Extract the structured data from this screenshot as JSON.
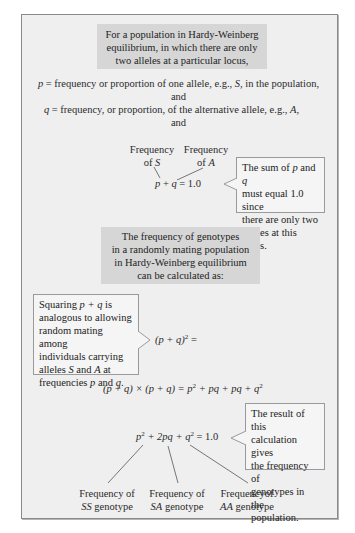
{
  "intro_box": {
    "lines": [
      "For a population in Hardy-Weinberg",
      "equilibrium, in which there are only",
      "two alleles at a particular locus,"
    ]
  },
  "definitions": {
    "p_symbol": "p",
    "p_text_a": " = frequency or proportion of one allele, e.g., ",
    "p_allele": "S",
    "p_text_b": ", in the population,",
    "and_1": "and",
    "q_symbol": "q",
    "q_text_a": " = frequency, or proportion, of the alternative allele, e.g., ",
    "q_allele": "A",
    "q_text_b": ",",
    "and_2": "and"
  },
  "sum_equation": {
    "label_s_line1": "Frequency",
    "label_s_line2_prefix": "of ",
    "label_s_allele": "S",
    "label_a_line1": "Frequency",
    "label_a_line2_prefix": "of ",
    "label_a_allele": "A",
    "p": "p",
    "plus": " + ",
    "q": "q",
    "equals": " = 1.0"
  },
  "sum_callout": {
    "line1_prefix": "The sum of ",
    "line1_p": "p",
    "line1_mid": " and ",
    "line1_q": "q",
    "line2": "must equal 1.0 since",
    "line3": "there are only two",
    "line4": "alleles at this locus."
  },
  "genotype_box": {
    "lines": [
      "The frequency of genotypes",
      "in a randomly mating population",
      "in Hardy-Weinberg equilibrium",
      "can be calculated as:"
    ]
  },
  "squaring_callout": {
    "line1_prefix": "Squaring ",
    "line1_expr": "p + q",
    "line1_suffix": " is",
    "line2": "analogous to allowing",
    "line3": "random mating among",
    "line4": "individuals carrying",
    "line5_prefix": "alleles ",
    "line5_s": "S",
    "line5_mid": " and ",
    "line5_a": "A",
    "line5_suffix": " at",
    "line6_prefix": "frequencies ",
    "line6_p": "p",
    "line6_mid": " and ",
    "line6_q": "q",
    "line6_suffix": "."
  },
  "square_equation": {
    "left": "(p + q)",
    "exp": "2",
    "right": " ="
  },
  "expansion_equation": {
    "lhs": "(p + q) × (p + q) = p",
    "exp1": "2",
    "mid": " + pq + pq + q",
    "exp2": "2"
  },
  "result_equation": {
    "p": "p",
    "exp1": "2",
    "mid": " + 2pq + q",
    "exp2": "2",
    "rhs": " = 1.0"
  },
  "result_callout": {
    "lines": [
      "The result of this",
      "calculation gives",
      "the frequency of",
      "genotypes in the",
      "population."
    ]
  },
  "genotype_labels": [
    {
      "line1": "Frequency of",
      "genotype": "SS",
      "suffix": " genotype"
    },
    {
      "line1": "Frequency of",
      "genotype": "SA",
      "suffix": " genotype"
    },
    {
      "line1": "Frequencyof",
      "genotype": "AA",
      "suffix": " genotype"
    }
  ],
  "colors": {
    "frame_bg": "#efefef",
    "header_box_bg": "#d6d6d6",
    "callout_bg": "#f5f5f5",
    "border": "#8a8a8a"
  }
}
